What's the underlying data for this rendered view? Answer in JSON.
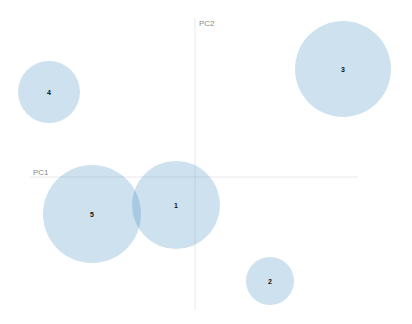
{
  "chart_data": {
    "type": "scatter",
    "title": "",
    "xlabel": "PC1",
    "ylabel": "PC2",
    "grid": false,
    "legend": null,
    "axes_origin_px": {
      "x": 195,
      "y": 177
    },
    "x_axis_px": [
      30,
      358
    ],
    "y_axis_px": [
      18,
      310
    ],
    "points": [
      {
        "label": "1",
        "cx": 176,
        "cy": 205,
        "r": 44
      },
      {
        "label": "2",
        "cx": 270,
        "cy": 281,
        "r": 24
      },
      {
        "label": "3",
        "cx": 343,
        "cy": 69,
        "r": 48
      },
      {
        "label": "4",
        "cx": 49,
        "cy": 92,
        "r": 31
      },
      {
        "label": "5",
        "cx": 92,
        "cy": 214,
        "r": 49
      }
    ],
    "colors": {
      "circle": "#1f77b4",
      "axis": "#e9e9e9",
      "axis_label": "#8a8a8a"
    }
  },
  "axes": {
    "pc1_label": "PC1",
    "pc2_label": "PC2"
  }
}
